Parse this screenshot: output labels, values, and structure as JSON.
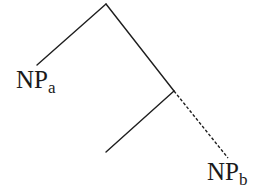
{
  "diagram": {
    "type": "syntax-tree",
    "nodes": [
      {
        "id": "root",
        "label": "",
        "children": [
          "np-a",
          "inner"
        ]
      },
      {
        "id": "np-a",
        "label": "NP",
        "subscript": "a"
      },
      {
        "id": "inner",
        "label": "",
        "children": [
          "unlabeled-leaf",
          "np-b"
        ]
      },
      {
        "id": "unlabeled-leaf",
        "label": ""
      },
      {
        "id": "np-b",
        "label": "NP",
        "subscript": "b"
      }
    ],
    "edges": [
      {
        "from": "root",
        "to": "np-a",
        "style": "solid"
      },
      {
        "from": "root",
        "to": "inner",
        "style": "solid"
      },
      {
        "from": "inner",
        "to": "unlabeled-leaf",
        "style": "solid"
      },
      {
        "from": "inner",
        "to": "np-b",
        "style": "dashed"
      }
    ],
    "labels": {
      "np_a": {
        "main": "NP",
        "sub": "a"
      },
      "np_b": {
        "main": "NP",
        "sub": "b"
      }
    },
    "colors": {
      "line": "#1e1e1e",
      "text": "#1a1a1a",
      "background": "#ffffff"
    }
  }
}
